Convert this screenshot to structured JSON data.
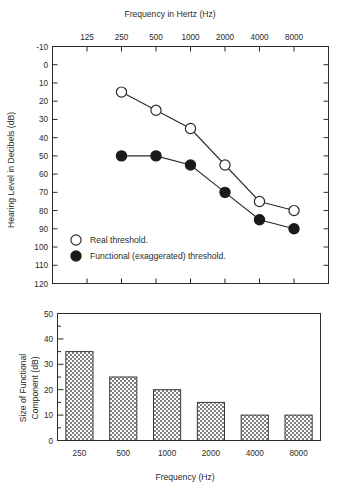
{
  "chart_data": [
    {
      "type": "line",
      "name": "audiogram",
      "title": "Frequency in Hertz (Hz)",
      "xlabel": "Frequency in Hertz (Hz)",
      "ylabel": "Hearing Level in Decibels (dB)",
      "x_tick_labels": [
        "125",
        "250",
        "500",
        "1000",
        "2000",
        "4000",
        "8000"
      ],
      "x_tick_values": [
        125,
        250,
        500,
        1000,
        2000,
        4000,
        8000
      ],
      "y_tick_labels": [
        "-10",
        "0",
        "10",
        "20",
        "30",
        "40",
        "50",
        "60",
        "70",
        "80",
        "90",
        "100",
        "110",
        "120"
      ],
      "y_tick_values": [
        -10,
        0,
        10,
        20,
        30,
        40,
        50,
        60,
        70,
        80,
        90,
        100,
        110,
        120
      ],
      "ylim": [
        -10,
        120
      ],
      "y_inverted": true,
      "grid": false,
      "axis_position": "top",
      "categories": [
        "250",
        "500",
        "1000",
        "2000",
        "4000",
        "8000"
      ],
      "series": [
        {
          "name": "Real threshold.",
          "marker": "open-circle",
          "x": [
            250,
            500,
            1000,
            2000,
            4000,
            8000
          ],
          "values": [
            15,
            25,
            35,
            55,
            75,
            80
          ]
        },
        {
          "name": "Functional (exaggerated) threshold.",
          "marker": "filled-circle",
          "x": [
            250,
            500,
            1000,
            2000,
            4000,
            8000
          ],
          "values": [
            50,
            50,
            55,
            70,
            85,
            90
          ]
        }
      ],
      "legend": {
        "position": "bottom-left",
        "entries": [
          {
            "label": "Real threshold.",
            "marker": "open-circle"
          },
          {
            "label": "Functional (exaggerated) threshold.",
            "marker": "filled-circle"
          }
        ]
      }
    },
    {
      "type": "bar",
      "name": "functional-component",
      "title": "",
      "xlabel": "Frequency (Hz)",
      "ylabel": "Size of Functional Component (dB)",
      "ylabel_line1": "Size of Functional",
      "ylabel_line2": "Component (dB)",
      "categories": [
        "250",
        "500",
        "1000",
        "2000",
        "4000",
        "8000"
      ],
      "values": [
        35,
        25,
        20,
        15,
        10,
        10
      ],
      "y_tick_labels": [
        "0",
        "10",
        "20",
        "30",
        "40",
        "50"
      ],
      "y_tick_values": [
        0,
        10,
        20,
        30,
        40,
        50
      ],
      "ylim": [
        0,
        50
      ],
      "minor_tick_step": 5,
      "grid": false,
      "bar_fill": "#b8b8b8",
      "bar_stroke": "#3a3a3a"
    }
  ],
  "colors": {
    "background": "#ffffff",
    "ink": "#2b2b2b",
    "marker_open_fill": "#ffffff",
    "marker_filled_fill": "#1a1a1a",
    "bar_fill": "#b8b8b8"
  }
}
